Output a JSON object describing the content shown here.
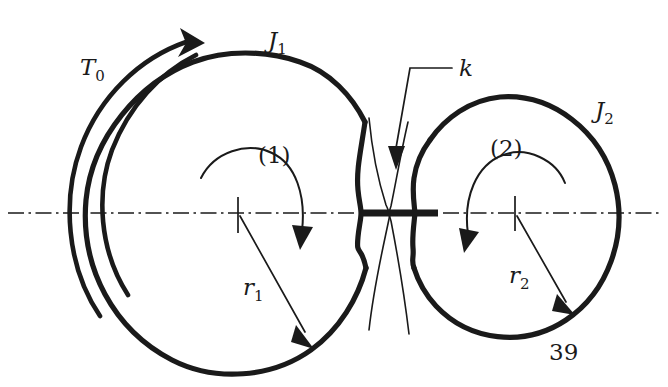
{
  "figure": {
    "caption_number": "39",
    "background_color": "#ffffff",
    "line_color": "#1a1a1a",
    "width": 668,
    "height": 387
  },
  "labels": {
    "applied_torque": "T",
    "applied_torque_sub": "0",
    "inertia_1": "J",
    "inertia_1_sub": "1",
    "inertia_2": "J",
    "inertia_2_sub": "2",
    "stiffness": "k",
    "radius_1": "r",
    "radius_1_sub": "1",
    "radius_2": "r",
    "radius_2_sub": "2",
    "coord_1": "(1)",
    "coord_2": "(2)",
    "figure_number": "39"
  },
  "geometry": {
    "disc1": {
      "cx": 238,
      "cy": 213,
      "r": 160
    },
    "disc2": {
      "cx": 505,
      "cy": 213,
      "r": 115
    },
    "shaft": {
      "x1": 360,
      "x2": 437,
      "y": 213
    },
    "centerline": {
      "x1": 8,
      "x2": 662,
      "y": 213
    }
  },
  "icons": {
    "torque_arrow": "curved-arrow-icon",
    "rotation_arrow_1": "rotation-arrow-icon",
    "rotation_arrow_2": "rotation-arrow-icon",
    "radius_arrow_1": "dimension-arrow-icon",
    "radius_arrow_2": "dimension-arrow-icon",
    "stiffness_leader": "leader-arrow-icon",
    "axis": "centerline-icon"
  }
}
